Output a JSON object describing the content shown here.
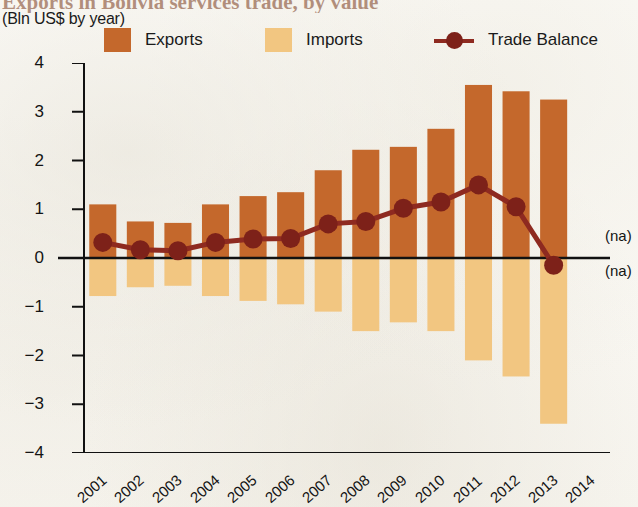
{
  "header": {
    "title": "Exports in Bolivia services trade, by value",
    "subtitle": "(Bln US$ by year)"
  },
  "legend": {
    "position": "top",
    "items": [
      {
        "label": "Exports",
        "color": "#c4682c",
        "marker": "square"
      },
      {
        "label": "Imports",
        "color": "#f2c681",
        "marker": "square"
      },
      {
        "label": "Trade Balance",
        "color": "#8e2a20",
        "marker": "line-dot"
      }
    ]
  },
  "annotations": {
    "na_top": "(na)",
    "na_bottom": "(na)"
  },
  "axis": {
    "y_ticks": [
      "4",
      "3",
      "2",
      "1",
      "0",
      "-1",
      "-2",
      "-3",
      "-4"
    ],
    "x_ticks": [
      "2001",
      "2002",
      "2003",
      "2004",
      "2005",
      "2006",
      "2007",
      "2008",
      "2009",
      "2010",
      "2011",
      "2012",
      "2013",
      "2014"
    ]
  },
  "chart_data": {
    "type": "bar",
    "title": "Exports in Bolivia services trade, by value",
    "subtitle": "(Bln US$ by year)",
    "xlabel": "",
    "ylabel": "",
    "ylim": [
      -4,
      4
    ],
    "ytick_step": 1,
    "grid": false,
    "legend_position": "top",
    "categories": [
      "2001",
      "2002",
      "2003",
      "2004",
      "2005",
      "2006",
      "2007",
      "2008",
      "2009",
      "2010",
      "2011",
      "2012",
      "2013",
      "2014"
    ],
    "series": [
      {
        "name": "Exports",
        "type": "bar",
        "color": "#c4682c",
        "values": [
          1.1,
          0.75,
          0.72,
          1.1,
          1.27,
          1.35,
          1.8,
          2.22,
          2.28,
          2.65,
          3.55,
          3.42,
          3.25,
          null
        ]
      },
      {
        "name": "Imports",
        "type": "bar",
        "color": "#f2c681",
        "values": [
          -0.78,
          -0.6,
          -0.57,
          -0.78,
          -0.88,
          -0.95,
          -1.1,
          -1.5,
          -1.32,
          -1.5,
          -2.1,
          -2.43,
          -3.4,
          null
        ]
      },
      {
        "name": "Trade Balance",
        "type": "line",
        "color": "#8e2a20",
        "values": [
          0.32,
          0.17,
          0.15,
          0.32,
          0.39,
          0.4,
          0.7,
          0.75,
          1.02,
          1.15,
          1.5,
          1.05,
          -0.15,
          null
        ]
      }
    ],
    "missing_label": "(na)",
    "missing_categories": [
      "2014"
    ]
  }
}
